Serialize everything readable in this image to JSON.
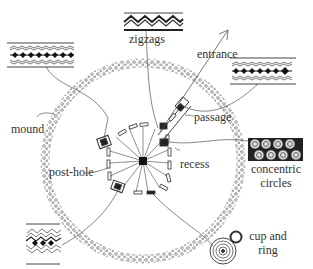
{
  "diagram": {
    "type": "archaeological-site-plan",
    "colors": {
      "ink": "#333333",
      "fill_dark": "#1a1a1a",
      "background": "#ffffff"
    },
    "labels": {
      "zigzags": "zigzags",
      "entrance": "entrance",
      "mound": "mound",
      "passage": "passage",
      "post_hole": "post-hole",
      "recess": "recess",
      "concentric_circles_1": "concentric",
      "concentric_circles_2": "circles",
      "cup_and_ring_1": "cup and",
      "cup_and_ring_2": "ring"
    },
    "motif_panels": [
      {
        "id": "zigzag-panel-top",
        "motif": "zigzags"
      },
      {
        "id": "lozenge-panel-left",
        "motif": "lozenges-between-zigzags"
      },
      {
        "id": "lozenge-panel-right",
        "motif": "lozenges-between-zigzags"
      },
      {
        "id": "concentric-circles-panel",
        "motif": "concentric circles"
      },
      {
        "id": "zigzag-lozenge-panel-bottom-left",
        "motif": "zigzag with lozenges"
      },
      {
        "id": "cup-and-ring-stone",
        "motif": "cup and ring"
      }
    ]
  }
}
